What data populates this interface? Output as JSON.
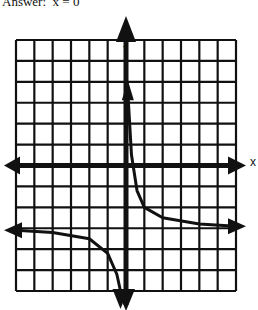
{
  "header": {
    "answer_text": "Answer:  x = 0"
  },
  "chart_data": {
    "type": "line",
    "title": "",
    "xlabel": "x",
    "ylabel": "y",
    "grid": true,
    "grid_cells": {
      "columns": 12,
      "rows": 12
    },
    "xlim": [
      -6,
      6
    ],
    "ylim": [
      -6,
      6
    ],
    "asymptotes": {
      "vertical": 0,
      "horizontal": -3
    },
    "series": [
      {
        "name": "right-branch",
        "points": [
          [
            0.1,
            3.5
          ],
          [
            0.3,
            0.5
          ],
          [
            0.6,
            -1.2
          ],
          [
            1,
            -2
          ],
          [
            2,
            -2.5
          ],
          [
            4,
            -2.8
          ],
          [
            6,
            -2.9
          ]
        ]
      },
      {
        "name": "left-branch",
        "points": [
          [
            -6,
            -3.1
          ],
          [
            -4,
            -3.2
          ],
          [
            -2,
            -3.5
          ],
          [
            -1,
            -4.2
          ],
          [
            -0.5,
            -5.2
          ],
          [
            -0.3,
            -6
          ]
        ]
      }
    ]
  }
}
